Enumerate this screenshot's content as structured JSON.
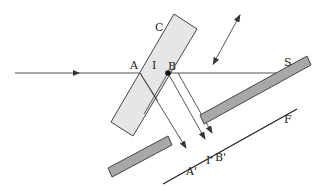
{
  "diagram": {
    "labels": {
      "plate": "C",
      "point_a": "A",
      "point_i": "I",
      "point_b": "B",
      "mirror": "S",
      "screen": "F",
      "image_a": "A'",
      "image_i": "I'",
      "image_b": "B'"
    },
    "colors": {
      "line": "#333333",
      "plate_fill": "#e6e6e6",
      "mirror_fill": "#a8a8a8",
      "stroke": "#444444"
    }
  }
}
